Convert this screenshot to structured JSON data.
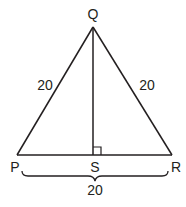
{
  "diagram": {
    "type": "isosceles-triangle-with-altitude",
    "vertices": {
      "Q": {
        "label": "Q",
        "x": 93,
        "y": 27
      },
      "P": {
        "label": "P",
        "x": 17,
        "y": 155
      },
      "R": {
        "label": "R",
        "x": 172,
        "y": 155
      },
      "S": {
        "label": "S",
        "x": 93,
        "y": 155
      }
    },
    "side_labels": {
      "PQ": "20",
      "QR": "20",
      "PR": "20"
    },
    "altitude": "QS",
    "right_angle_at": "S",
    "stroke_color": "#231f20"
  }
}
